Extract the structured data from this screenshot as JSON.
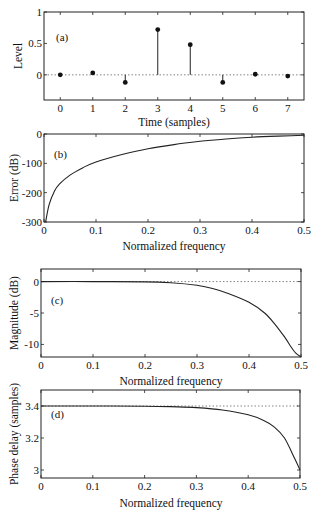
{
  "figure": {
    "panels": [
      "(a)",
      "(b)",
      "(c)",
      "(d)"
    ]
  },
  "chart_data": [
    {
      "id": "a",
      "type": "stem",
      "panel_label": "(a)",
      "title": "",
      "xlabel": "Time (samples)",
      "ylabel": "Level",
      "x": [
        0,
        1,
        2,
        3,
        4,
        5,
        6,
        7
      ],
      "values": [
        0.0,
        0.03,
        -0.12,
        0.72,
        0.48,
        -0.12,
        0.01,
        -0.02
      ],
      "xlim": [
        -0.5,
        7.5
      ],
      "ylim": [
        -0.4,
        1.0
      ],
      "xticks": [
        "0",
        "1",
        "2",
        "3",
        "4",
        "5",
        "6",
        "7"
      ],
      "yticks": [
        "0",
        "0.5",
        "1"
      ],
      "ytick_values": [
        0,
        0.5,
        1
      ],
      "reference_line": {
        "y": 0,
        "style": "dotted"
      },
      "grid": false
    },
    {
      "id": "b",
      "type": "line",
      "panel_label": "(b)",
      "xlabel": "Normalized frequency",
      "ylabel": "Error (dB)",
      "x": [
        0.003,
        0.01,
        0.02,
        0.03,
        0.05,
        0.075,
        0.1,
        0.15,
        0.2,
        0.25,
        0.3,
        0.35,
        0.4,
        0.45,
        0.5
      ],
      "values": [
        -300,
        -240,
        -195,
        -170,
        -140,
        -115,
        -95,
        -70,
        -50,
        -36,
        -25,
        -17,
        -11,
        -7,
        -4
      ],
      "xlim": [
        0,
        0.5
      ],
      "ylim": [
        -300,
        0
      ],
      "xticks": [
        "0",
        "0.1",
        "0.2",
        "0.3",
        "0.4",
        "0.5"
      ],
      "xtick_values": [
        0,
        0.1,
        0.2,
        0.3,
        0.4,
        0.5
      ],
      "yticks": [
        "0",
        "-100",
        "-200",
        "-300"
      ],
      "ytick_values": [
        0,
        -100,
        -200,
        -300
      ],
      "grid": false
    },
    {
      "id": "c",
      "type": "line",
      "panel_label": "(c)",
      "xlabel": "Normalized frequency",
      "ylabel": "Magnitude (dB)",
      "x": [
        0,
        0.1,
        0.2,
        0.25,
        0.3,
        0.33,
        0.36,
        0.4,
        0.43,
        0.45,
        0.47,
        0.48,
        0.49,
        0.5
      ],
      "values": [
        0,
        0,
        -0.05,
        -0.2,
        -0.6,
        -1.1,
        -1.9,
        -3.3,
        -5.0,
        -6.8,
        -9.0,
        -10.3,
        -11.4,
        -12
      ],
      "xlim": [
        0,
        0.5
      ],
      "ylim": [
        -12,
        2
      ],
      "xticks": [
        "0",
        "0.1",
        "0.2",
        "0.3",
        "0.4",
        "0.5"
      ],
      "xtick_values": [
        0,
        0.1,
        0.2,
        0.3,
        0.4,
        0.5
      ],
      "yticks": [
        "0",
        "-5",
        "-10"
      ],
      "ytick_values": [
        0,
        -5,
        -10
      ],
      "reference_line": {
        "y": 0,
        "style": "dotted"
      },
      "grid": false
    },
    {
      "id": "d",
      "type": "line",
      "panel_label": "(d)",
      "xlabel": "Normalized frequency",
      "ylabel": "Phase delay (samples)",
      "x": [
        0,
        0.1,
        0.2,
        0.25,
        0.3,
        0.35,
        0.4,
        0.43,
        0.45,
        0.47,
        0.49,
        0.5
      ],
      "values": [
        3.4,
        3.4,
        3.399,
        3.396,
        3.39,
        3.375,
        3.345,
        3.31,
        3.27,
        3.2,
        3.07,
        3.0
      ],
      "xlim": [
        0,
        0.5
      ],
      "ylim": [
        2.95,
        3.5
      ],
      "xticks": [
        "0",
        "0.1",
        "0.2",
        "0.3",
        "0.4",
        "0.5"
      ],
      "xtick_values": [
        0,
        0.1,
        0.2,
        0.3,
        0.4,
        0.5
      ],
      "yticks": [
        "3",
        "3.2",
        "3.4"
      ],
      "ytick_values": [
        3.0,
        3.2,
        3.4
      ],
      "reference_line": {
        "y": 3.4,
        "style": "dotted"
      },
      "grid": false
    }
  ]
}
